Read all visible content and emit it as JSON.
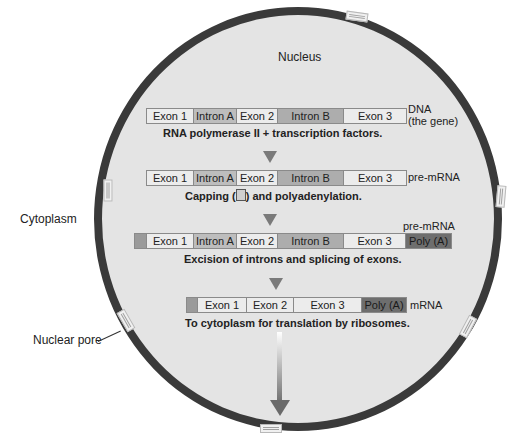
{
  "labels": {
    "nucleus": "Nucleus",
    "cytoplasm": "Cytoplasm",
    "nuclear_pore": "Nuclear pore"
  },
  "rows": [
    {
      "segments": [
        "Exon 1",
        "Intron A",
        "Exon 2",
        "Intron B",
        "Exon 3"
      ],
      "side_label": "DNA",
      "side_label_2": "(the gene)",
      "caption": "RNA polymerase II + transcription factors."
    },
    {
      "segments": [
        "Exon 1",
        "Intron A",
        "Exon 2",
        "Intron B",
        "Exon 3"
      ],
      "side_label": "pre-mRNA",
      "caption_before": "Capping (",
      "caption_after": ") and polyadenylation."
    },
    {
      "segments": [
        "Exon 1",
        "Intron A",
        "Exon 2",
        "Intron B",
        "Exon 3",
        "Poly (A)"
      ],
      "top_label": "pre-mRNA",
      "caption": "Excision of introns and splicing of exons."
    },
    {
      "segments": [
        "Exon 1",
        "Exon 2",
        "Exon 3",
        "Poly (A)"
      ],
      "side_label": "mRNA",
      "caption": "To cytoplasm for translation by ribosomes."
    }
  ],
  "colors": {
    "membrane": "#3a3a3a",
    "nucleoplasm": "#e4e4e4",
    "exon": "#ececec",
    "intron": "#b5b5b5",
    "poly_a": "#6e6e6e"
  }
}
